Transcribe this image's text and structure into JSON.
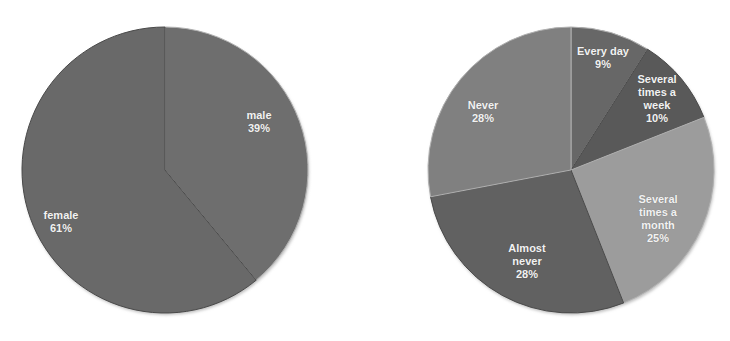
{
  "chart_data": [
    {
      "type": "pie",
      "title": "",
      "start_angle_deg": 0,
      "direction": "clockwise",
      "categories": [
        "male",
        "female"
      ],
      "values": [
        39,
        61
      ],
      "unit": "%",
      "colors": [
        "#6e6e6e",
        "#696969"
      ],
      "labels": [
        {
          "text": "male\n39%",
          "x": 259,
          "y": 122
        },
        {
          "text": "female\n61%",
          "x": 61,
          "y": 222
        }
      ],
      "legend": null
    },
    {
      "type": "pie",
      "title": "",
      "start_angle_deg": 0,
      "direction": "clockwise",
      "categories": [
        "Every day",
        "Several times a week",
        "Several times a month",
        "Almost never",
        "Never"
      ],
      "values": [
        9,
        10,
        25,
        28,
        28
      ],
      "unit": "%",
      "colors": [
        "#676767",
        "#595959",
        "#9c9c9c",
        "#616161",
        "#808080"
      ],
      "labels": [
        {
          "text": "Every day\n9%",
          "x": 238,
          "y": 58
        },
        {
          "text": "Several\ntimes a\nweek\n10%",
          "x": 292,
          "y": 99
        },
        {
          "text": "Several\ntimes a\nmonth\n25%",
          "x": 293,
          "y": 219
        },
        {
          "text": "Almost\nnever\n28%",
          "x": 162,
          "y": 261
        },
        {
          "text": "Never\n28%",
          "x": 118,
          "y": 112
        }
      ],
      "legend": null
    }
  ]
}
